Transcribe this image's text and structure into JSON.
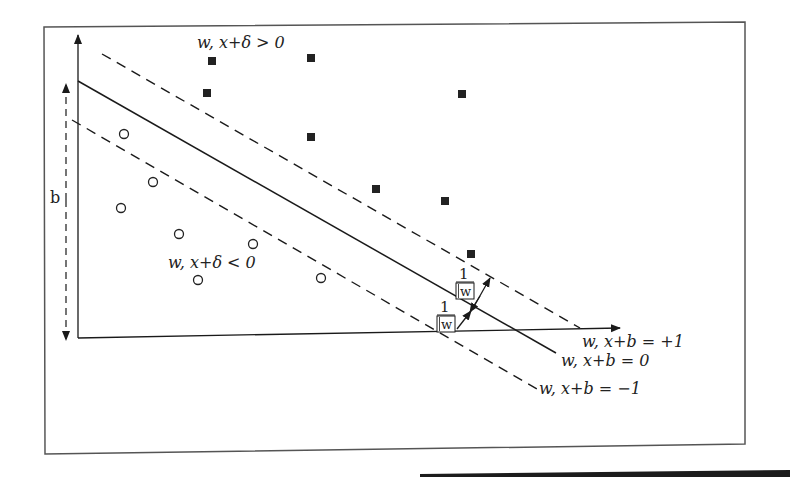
{
  "figure": {
    "labels": {
      "positive_region": "w, x+δ > 0",
      "negative_region": "w, x+δ < 0",
      "upper_margin": "w, x+b = +1",
      "decision_boundary": "w, x+b = 0",
      "lower_margin": "w, x+b = −1",
      "bias": "b",
      "margin_numerator": "1",
      "margin_denominator": "w"
    },
    "positive_points": [
      {
        "x": 212,
        "y": 61
      },
      {
        "x": 311,
        "y": 58
      },
      {
        "x": 207,
        "y": 93
      },
      {
        "x": 462,
        "y": 94
      },
      {
        "x": 311,
        "y": 137
      },
      {
        "x": 376,
        "y": 189
      },
      {
        "x": 445,
        "y": 201
      },
      {
        "x": 471,
        "y": 254
      }
    ],
    "negative_points": [
      {
        "x": 124,
        "y": 134
      },
      {
        "x": 153,
        "y": 182
      },
      {
        "x": 121,
        "y": 208
      },
      {
        "x": 179,
        "y": 234
      },
      {
        "x": 253,
        "y": 244
      },
      {
        "x": 198,
        "y": 280
      },
      {
        "x": 321,
        "y": 278
      }
    ],
    "colors": {
      "ink": "#1a1a1a",
      "frame": "#555555",
      "background": "#ffffff"
    }
  }
}
